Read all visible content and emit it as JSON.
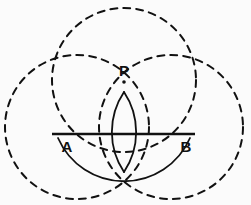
{
  "figure": {
    "kind": "compass-and-straightedge-construction",
    "background_color": "#fbfbfb",
    "stroke_color": "#111111",
    "width": 251,
    "height": 205
  },
  "labels": [
    {
      "id": "label-p",
      "text": "P",
      "x": 124,
      "y": 76,
      "anchor": "middle"
    },
    {
      "id": "label-a",
      "text": "A",
      "x": 67,
      "y": 152,
      "anchor": "middle"
    },
    {
      "id": "label-b",
      "text": "B",
      "x": 186,
      "y": 152,
      "anchor": "middle"
    }
  ],
  "points": [
    {
      "id": "point-p",
      "name": "P",
      "cx": 124,
      "cy": 82,
      "r": 1.8
    }
  ],
  "segments": [
    {
      "id": "segment-ab",
      "name": "AB",
      "x1": 52,
      "y1": 134,
      "x2": 195,
      "y2": 134,
      "stroke_width": 2.6
    }
  ],
  "dashed_circles": [
    {
      "id": "circle-top",
      "name": "top-construction-circle",
      "cx": 124,
      "cy": 80,
      "r": 72,
      "stroke_width": 2.0,
      "dash": "7 6"
    },
    {
      "id": "circle-left",
      "name": "left-construction-circle",
      "cx": 77,
      "cy": 127,
      "r": 72,
      "stroke_width": 2.0,
      "dash": "7 6"
    },
    {
      "id": "circle-right",
      "name": "right-construction-circle",
      "cx": 171,
      "cy": 127,
      "r": 72,
      "stroke_width": 2.0,
      "dash": "7 6"
    }
  ],
  "solid_arcs": [
    {
      "id": "arc-left-lens",
      "name": "left-center-solid-arc",
      "path": "M 124 92 A 72 72 0 0 1 124 172",
      "stroke_width": 1.8
    },
    {
      "id": "arc-right-lens",
      "name": "right-center-solid-arc",
      "path": "M 124 92 A 72 72 0 0 0 124 172",
      "stroke_width": 1.8
    },
    {
      "id": "arc-lower-ab",
      "name": "lower-arc-through-a-and-b",
      "path": "M 58 138 A 72 72 0 0 0 190 138",
      "stroke_width": 1.8
    }
  ]
}
